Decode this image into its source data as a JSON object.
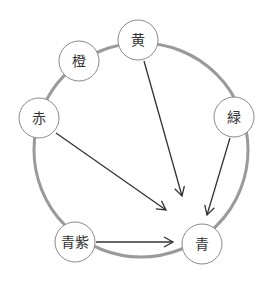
{
  "diagram": {
    "ring": {
      "cx": 141,
      "cy": 150,
      "r": 107,
      "color": "#9a9a9a",
      "width": 3
    },
    "node_radius": 20,
    "node_stroke": "#8a8a8a",
    "arrow_color": "#333333",
    "nodes": [
      {
        "id": "yellow",
        "label": "黄",
        "cx": 138,
        "cy": 40
      },
      {
        "id": "orange",
        "label": "橙",
        "cx": 79,
        "cy": 61
      },
      {
        "id": "red",
        "label": "赤",
        "cx": 39,
        "cy": 118
      },
      {
        "id": "green",
        "label": "緑",
        "cx": 234,
        "cy": 117
      },
      {
        "id": "blue-violet",
        "label": "青紫",
        "cx": 75,
        "cy": 242
      },
      {
        "id": "blue",
        "label": "青",
        "cx": 202,
        "cy": 244
      }
    ],
    "arrows": [
      {
        "from": "黄",
        "to": "青",
        "x1": 144,
        "y1": 61,
        "x2": 182,
        "y2": 196
      },
      {
        "from": "赤",
        "to": "青",
        "x1": 56,
        "y1": 133,
        "x2": 166,
        "y2": 210
      },
      {
        "from": "緑",
        "to": "青",
        "x1": 230,
        "y1": 138,
        "x2": 207,
        "y2": 215
      },
      {
        "from": "青紫",
        "to": "青",
        "x1": 96,
        "y1": 242,
        "x2": 173,
        "y2": 242
      }
    ]
  }
}
